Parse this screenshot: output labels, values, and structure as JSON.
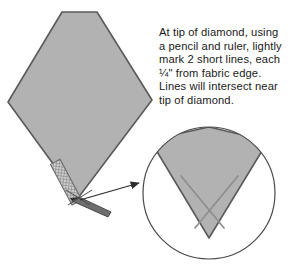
{
  "figure": {
    "instruction_text": "At tip of diamond, using a pencil and ruler, lightly mark 2 short lines, each ¼\" from fabric edge. Lines will intersect near tip of diamond.",
    "colors": {
      "fabric_gray": "#b2b2b2",
      "outline_dark": "#555555",
      "circle_outline": "#4a4a4a",
      "pencil_line": "#9a9a9a",
      "arrow": "#2b2b2b",
      "ruler_fill": "#c9c9c9",
      "pencil_body": "#6e6e6e",
      "text": "#1a1a1a",
      "background": "#ffffff"
    },
    "shapes": {
      "diamond": {
        "label": "fabric diamond piece",
        "points": "62,12 97,12 152,100 78,198 8,102",
        "fill": "#b2b2b2"
      },
      "ruler": {
        "label": "hatched ruler",
        "measurement": "¼\"",
        "fill": "#c9c9c9"
      },
      "pencil": {
        "label": "pencil",
        "fill": "#6e6e6e"
      },
      "arrow": {
        "label": "callout arrow pointing to magnified inset",
        "from": "80,200",
        "to": "140,183"
      },
      "inset_circle": {
        "label": "magnified view of diamond tip",
        "cx": 209,
        "cy": 193,
        "r": 66,
        "stroke": "#4a4a4a"
      },
      "inset_wedge": {
        "label": "magnified diamond tip wedge",
        "points": "155,152 209,132 264,153 209,237",
        "fill": "#b2b2b2"
      },
      "mark_line_left": {
        "label": "pencil mark line left",
        "from": "181,178",
        "to": "222,226"
      },
      "mark_line_right": {
        "label": "pencil mark line right",
        "from": "238,178",
        "to": "197,226"
      }
    }
  }
}
